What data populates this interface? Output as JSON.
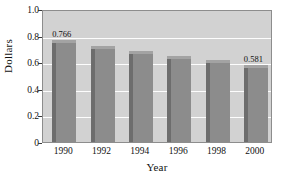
{
  "chart_data": {
    "type": "bar",
    "title": "",
    "xlabel": "Year",
    "ylabel": "Dollars",
    "categories": [
      "1990",
      "1992",
      "1994",
      "1996",
      "1998",
      "2000"
    ],
    "values": [
      0.766,
      0.723,
      0.687,
      0.648,
      0.614,
      0.581
    ],
    "point_labels": [
      {
        "category": "1990",
        "text": "0.766"
      },
      {
        "category": "2000",
        "text": "0.581"
      }
    ],
    "ylim": [
      0,
      1.0
    ],
    "yticks": [
      0,
      0.2,
      0.4,
      0.6,
      0.8,
      1.0
    ],
    "ytick_labels": [
      "0",
      "0.2",
      "0.4",
      "0.6",
      "0.8",
      "1.0"
    ],
    "grid": "horizontal",
    "gridline_color": "#fdfdfd",
    "legend": "none",
    "plot_background": "#d2d2d2",
    "bar_color": "#8c8c8c",
    "bar_shadow_color": "#6d6d6d",
    "bar_highlight_color": "#a3a3a3",
    "axis_color": "#8d8d8d",
    "page_background": "#ffffff"
  }
}
